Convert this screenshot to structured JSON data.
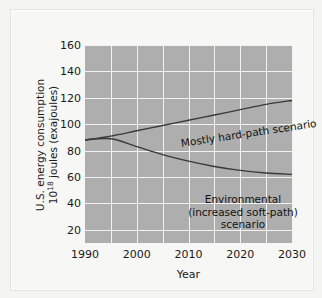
{
  "figure": {
    "background_color": "#f4f4f2",
    "plot_background_color": "#aeaeae",
    "gridline_color": "#f2f2f0",
    "curve_color": "#3a3a3a"
  },
  "axes": {
    "y_title_line1": "U.S. energy consumption",
    "y_title_line2_prefix": "10",
    "y_title_line2_sup": "18",
    "y_title_line2_suffix": " joules (exajoules)",
    "x_title": "Year",
    "y_ticks": [
      "160",
      "140",
      "120",
      "100",
      "80",
      "60",
      "40",
      "20"
    ],
    "x_ticks": [
      "1990",
      "2000",
      "2010",
      "2020",
      "2030"
    ]
  },
  "annotations": {
    "hard_path_label": "Mostly hard-path scenario",
    "soft_path_label_line1": "Environmental",
    "soft_path_label_line2": "(increased soft-path)",
    "soft_path_label_line3": "scenario"
  },
  "chart_data": {
    "type": "line",
    "title": "",
    "xlabel": "Year",
    "ylabel": "U.S. energy consumption 10^18 joules (exajoules)",
    "xlim": [
      1990,
      2030
    ],
    "ylim": [
      10,
      160
    ],
    "grid": true,
    "x_tick_values": [
      1990,
      2000,
      2010,
      2020,
      2030
    ],
    "x_gridline_values": [
      1990,
      1995,
      2000,
      2005,
      2010,
      2015,
      2020,
      2025,
      2030
    ],
    "y_tick_values": [
      20,
      40,
      60,
      80,
      100,
      120,
      140,
      160
    ],
    "legend": "inline-annotations",
    "series": [
      {
        "name": "Mostly hard-path scenario",
        "x": [
          1990,
          1995,
          2000,
          2005,
          2010,
          2015,
          2020,
          2025,
          2030
        ],
        "values": [
          88,
          91,
          95,
          99,
          103,
          107,
          111,
          115,
          118
        ]
      },
      {
        "name": "Environmental (increased soft-path) scenario",
        "x": [
          1990,
          1995,
          2000,
          2005,
          2010,
          2015,
          2020,
          2025,
          2030
        ],
        "values": [
          88,
          89,
          83,
          77,
          72,
          68,
          65,
          63,
          62
        ]
      }
    ]
  }
}
